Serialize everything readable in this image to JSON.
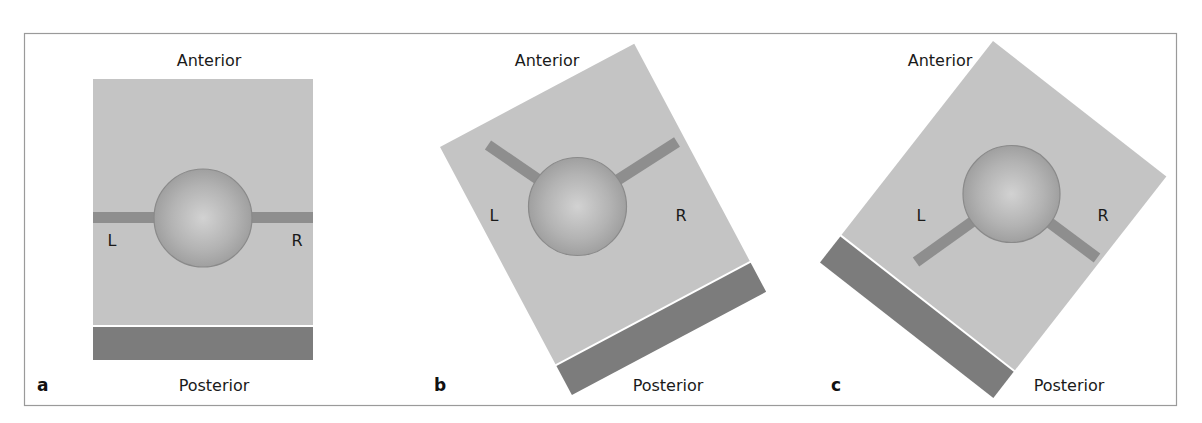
{
  "figure": {
    "panels": [
      {
        "letter": "a",
        "top_label": "Anterior",
        "bottom_label": "Posterior",
        "left_label": "L",
        "right_label": "R",
        "tilt_deg": 0
      },
      {
        "letter": "b",
        "top_label": "Anterior",
        "bottom_label": "Posterior",
        "left_label": "L",
        "right_label": "R",
        "tilt_deg": -28
      },
      {
        "letter": "c",
        "top_label": "Anterior",
        "bottom_label": "Posterior",
        "left_label": "L",
        "right_label": "R",
        "tilt_deg": 38
      }
    ],
    "colors": {
      "field": "#c4c4c4",
      "base_bar": "#7c7c7c",
      "arm": "#8e8e8e",
      "sphere_light": "#cfcfcf",
      "sphere_dark": "#9c9c9c",
      "sphere_outline": "#8a8a8a",
      "frame": "#9a9a9a"
    }
  }
}
